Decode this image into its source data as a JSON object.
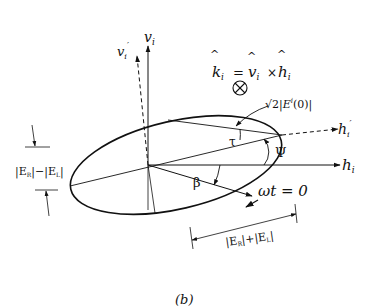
{
  "diagram": {
    "panel_label": "(b)",
    "axes": {
      "v_i": "v",
      "v_i_sub": "i",
      "v_i_prime": "v",
      "v_i_prime_sub": "i",
      "v_i_prime_mark": "′",
      "h_i": "h",
      "h_i_sub": "i",
      "h_i_prime": "h",
      "h_i_prime_sub": "i",
      "h_i_prime_mark": "′"
    },
    "equation": {
      "k": "k",
      "sub": "i",
      "equals": "=",
      "v": "v",
      "times": "×",
      "h": "h",
      "into_page_symbol": "⊗"
    },
    "angles": {
      "tau": "τ",
      "psi": "Ψ",
      "beta": "β"
    },
    "annotations": {
      "amplitude_label_sqrt": "√2",
      "amplitude_label_rest": "|E",
      "amplitude_sup": "i",
      "amplitude_tail": "(0)|",
      "start_label": "ωt = 0",
      "minor_axis_label": "|E",
      "minor_sub_R": "R",
      "minor_mid": "|−|E",
      "minor_sub_L": "L",
      "minor_end": "|",
      "major_axis_label": "|E",
      "major_sub_R": "R",
      "major_mid": "|+|E",
      "major_sub_L": "L",
      "major_end": "|"
    }
  }
}
